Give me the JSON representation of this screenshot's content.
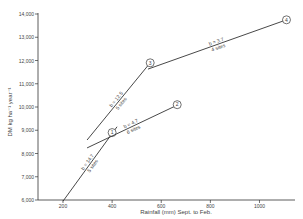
{
  "chart_data": {
    "type": "line",
    "title": "",
    "xlabel": "Rainfall (mm) Sept. to Feb.",
    "ylabel": "DM kg ha⁻¹ year⁻¹",
    "xlim": [
      200,
      1150
    ],
    "ylim": [
      6000,
      14000
    ],
    "x_ticks": [
      200,
      400,
      600,
      800,
      1000
    ],
    "x_tick_labels": [
      "200",
      "400",
      "600",
      "800",
      "1000"
    ],
    "y_ticks": [
      6000,
      7000,
      8000,
      9000,
      10000,
      11000,
      12000,
      13000,
      14000
    ],
    "y_tick_labels": [
      "6,000",
      "7,000",
      "8,000",
      "9,000",
      "10,000",
      "11,000",
      "12,000",
      "13,000",
      "14,000"
    ],
    "grid": false,
    "legend": "none",
    "series": [
      {
        "name": "1",
        "slope_label": "b = 14.7",
        "sites_label": "5 sites",
        "x": [
          200,
          420
        ],
        "y": [
          5950,
          9150
        ],
        "marker": {
          "x": 400,
          "y": 8900,
          "label": "1"
        }
      },
      {
        "name": "2",
        "slope_label": "b = 4.7",
        "sites_label": "6 sites",
        "x": [
          298,
          665
        ],
        "y": [
          8240,
          10080
        ],
        "marker": {
          "x": 665,
          "y": 10100,
          "label": "2"
        }
      },
      {
        "name": "3",
        "slope_label": "b = 12.5",
        "sites_label": "5 sites",
        "x": [
          298,
          555
        ],
        "y": [
          8580,
          11900
        ],
        "marker": {
          "x": 555,
          "y": 11900,
          "label": "3"
        }
      },
      {
        "name": "4",
        "slope_label": "b = 3.7",
        "sites_label": "4 sites",
        "x": [
          546,
          1110
        ],
        "y": [
          11630,
          13750
        ],
        "marker": {
          "x": 1110,
          "y": 13750,
          "label": "4"
        }
      }
    ]
  },
  "colors": {
    "line": "#333333",
    "axis": "#333333",
    "text": "#444444",
    "background": "#ffffff"
  }
}
